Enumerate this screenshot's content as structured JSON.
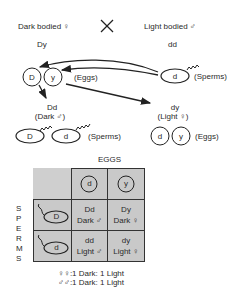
{
  "parents": {
    "female": {
      "label": "Dark bodied ♀",
      "genotype": "Dy"
    },
    "cross_symbol": "✕",
    "male": {
      "label": "Light bodied ♂",
      "genotype": "dd"
    }
  },
  "parent_gametes": {
    "female_eggs": [
      "D",
      "y"
    ],
    "eggs_label": "(Eggs)",
    "male_sperm": "d",
    "sperms_label": "(Sperms)"
  },
  "f1": {
    "male": {
      "genotype": "Dd",
      "phenotype": "(Dark ♂)"
    },
    "female": {
      "genotype": "dy",
      "phenotype": "(Light ♀)"
    }
  },
  "f1_gametes": {
    "male_sperms": [
      "D",
      "d"
    ],
    "sperms_label": "(Sperms)",
    "female_eggs": [
      "d",
      "y"
    ],
    "eggs_label": "(Eggs)"
  },
  "punnett": {
    "eggs_header": "EGGS",
    "sperms_header": [
      "S",
      "P",
      "E",
      "R",
      "M",
      "S"
    ],
    "egg_columns": [
      "d",
      "y"
    ],
    "sperm_rows": [
      "D",
      "d"
    ],
    "cells": [
      [
        {
          "genotype": "Dd",
          "phenotype": "Dark ♂"
        },
        {
          "genotype": "Dy",
          "phenotype": "Dark ♀"
        }
      ],
      [
        {
          "genotype": "dd",
          "phenotype": "Light ♂"
        },
        {
          "genotype": "dy",
          "phenotype": "Light ♀"
        }
      ]
    ]
  },
  "ratios": [
    {
      "sex": "♀♀:",
      "ratio": "1 Dark: 1 Light"
    },
    {
      "sex": "♂♂:",
      "ratio": "1 Dark: 1 Light"
    }
  ],
  "colors": {
    "line": "#222222",
    "cell": "#c9c9c9",
    "text": "#2a2a2a"
  }
}
